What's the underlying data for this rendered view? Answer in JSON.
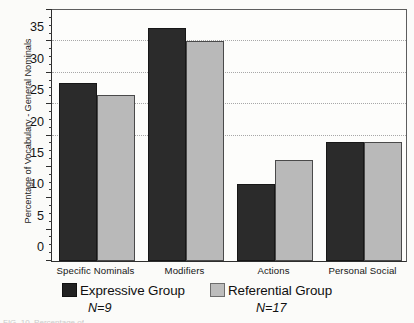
{
  "chart_data": {
    "type": "bar",
    "title": "",
    "xlabel": "",
    "ylabel": "Percentage of Vocabulary - General Nominals",
    "ylim": [
      0,
      40
    ],
    "ytick_step": 5,
    "yticks": [
      0,
      5,
      10,
      15,
      20,
      25,
      30,
      35,
      40
    ],
    "ytick_labels": [
      "0",
      "5",
      "10",
      "15",
      "20",
      "25",
      "30",
      "35",
      "40"
    ],
    "minor_tick_step": 1.25,
    "grid": "horizontal-dotted",
    "gridline_values": [
      20,
      25,
      30,
      35
    ],
    "legend_position": "below-axes",
    "categories": [
      "Specific Nominals",
      "Modifiers",
      "Actions",
      "Personal Social"
    ],
    "series": [
      {
        "name": "Expressive Group",
        "n_label": "N=9",
        "color": "#2b2b2b",
        "values": [
          28.3,
          37.2,
          12.3,
          19.0
        ]
      },
      {
        "name": "Referential Group",
        "n_label": "N=17",
        "color": "#b9b9b9",
        "values": [
          26.5,
          35.0,
          16.1,
          19.0
        ]
      }
    ]
  },
  "legend": {
    "entries": [
      {
        "label": "Expressive Group",
        "n": "N=9"
      },
      {
        "label": "Referential Group",
        "n": "N=17"
      }
    ]
  },
  "caption_sliver": "FIG. 10.  Percentage of"
}
